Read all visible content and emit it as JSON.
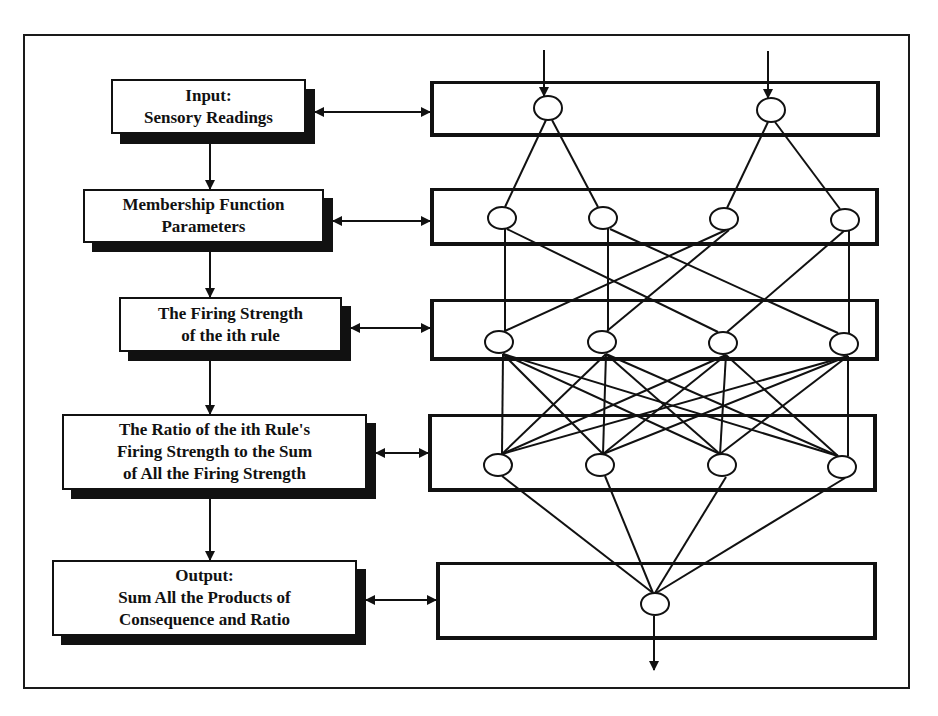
{
  "diagram": {
    "type": "ANFIS architecture",
    "stages": [
      {
        "id": "input",
        "lines": [
          "Input:",
          "Sensory Readings"
        ]
      },
      {
        "id": "membership",
        "lines": [
          "Membership Function",
          "Parameters"
        ]
      },
      {
        "id": "firing",
        "lines": [
          "The Firing Strength",
          "of the ith rule"
        ]
      },
      {
        "id": "ratio",
        "lines": [
          "The Ratio of the ith Rule's",
          "Firing Strength to the Sum",
          "of All the Firing Strength"
        ]
      },
      {
        "id": "output",
        "lines": [
          "Output:",
          "Sum All the Products of",
          "Consequence and Ratio"
        ]
      }
    ],
    "network": {
      "layers": [
        {
          "name": "layer-1",
          "node_count": 2
        },
        {
          "name": "layer-2",
          "node_count": 4
        },
        {
          "name": "layer-3",
          "node_count": 4
        },
        {
          "name": "layer-4",
          "node_count": 4
        },
        {
          "name": "layer-5",
          "node_count": 1
        }
      ],
      "inputs": 2,
      "outputs": 1
    },
    "colors": {
      "stroke": "#111111",
      "background": "#ffffff"
    }
  }
}
